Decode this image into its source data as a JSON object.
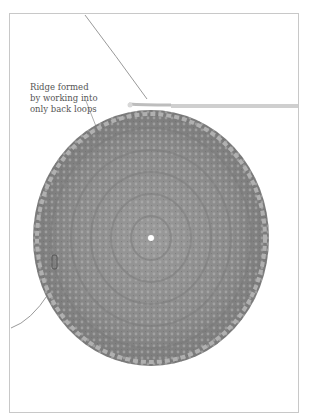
{
  "figure": {
    "callout": {
      "lines": [
        "Ridge formed",
        "by working into",
        "only back loops"
      ]
    },
    "colors": {
      "yarn": "#8f8f8f",
      "yarn_dark": "#6e6e6e",
      "yarn_light": "#b4b4b4",
      "hook": "#cfcfcf",
      "border": "#c8c8c8",
      "text": "#555555"
    }
  }
}
